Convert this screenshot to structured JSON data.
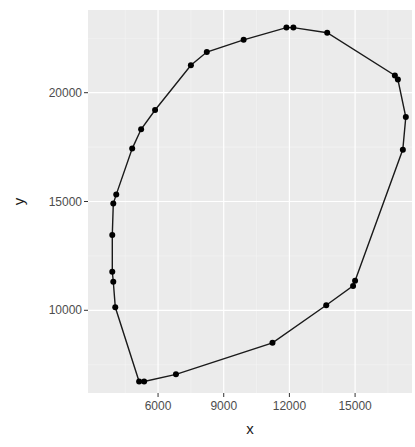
{
  "chart_data": {
    "type": "line",
    "subtype": "closed-polygon-with-points",
    "title": "",
    "xlabel": "x",
    "ylabel": "y",
    "xlim": [
      2800,
      17600
    ],
    "ylim": [
      6200,
      23800
    ],
    "x_ticks": [
      6000,
      9000,
      12000,
      15000
    ],
    "y_ticks": [
      10000,
      15000,
      20000
    ],
    "x_minor": [
      4500,
      7500,
      10500,
      13500,
      16500
    ],
    "y_minor": [
      7500,
      12500,
      17500,
      22500
    ],
    "grid": true,
    "legend": null,
    "series": [
      {
        "name": "hull",
        "closed": true,
        "points": [
          {
            "x": 11864,
            "y": 22991
          },
          {
            "x": 12182,
            "y": 22991
          },
          {
            "x": 13727,
            "y": 22757
          },
          {
            "x": 16818,
            "y": 20794
          },
          {
            "x": 16955,
            "y": 20607
          },
          {
            "x": 17318,
            "y": 18879
          },
          {
            "x": 17182,
            "y": 17383
          },
          {
            "x": 15000,
            "y": 11355
          },
          {
            "x": 14909,
            "y": 11121
          },
          {
            "x": 13682,
            "y": 10234
          },
          {
            "x": 11227,
            "y": 8505
          },
          {
            "x": 6818,
            "y": 7056
          },
          {
            "x": 5364,
            "y": 6729
          },
          {
            "x": 5136,
            "y": 6729
          },
          {
            "x": 4045,
            "y": 10140
          },
          {
            "x": 3955,
            "y": 11308
          },
          {
            "x": 3909,
            "y": 11776
          },
          {
            "x": 3909,
            "y": 13458
          },
          {
            "x": 3955,
            "y": 14907
          },
          {
            "x": 4091,
            "y": 15327
          },
          {
            "x": 4818,
            "y": 17430
          },
          {
            "x": 5227,
            "y": 18318
          },
          {
            "x": 5864,
            "y": 19206
          },
          {
            "x": 7500,
            "y": 21262
          },
          {
            "x": 8227,
            "y": 21869
          },
          {
            "x": 9909,
            "y": 22430
          }
        ]
      }
    ],
    "colors": {
      "panel_bg": "#ebebeb",
      "grid_major": "#ffffff",
      "grid_minor": "#f5f5f5",
      "line": "#1a1a1a",
      "point": "#000000",
      "tick_text": "#4d4d4d",
      "tick_mark": "#333333"
    }
  }
}
